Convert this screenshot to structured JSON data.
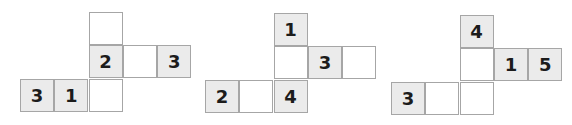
{
  "colors": {
    "shaded": "#ebebeb",
    "blank": "#ffffff",
    "border": "#a6a6a6",
    "text": "#1c1c1c"
  },
  "nets": [
    {
      "origin": [
        20,
        12
      ],
      "cells": [
        {
          "col": 2,
          "row": 0,
          "label": "",
          "shaded": false
        },
        {
          "col": 2,
          "row": 1,
          "label": "2",
          "shaded": true
        },
        {
          "col": 3,
          "row": 1,
          "label": "",
          "shaded": false
        },
        {
          "col": 4,
          "row": 1,
          "label": "3",
          "shaded": true
        },
        {
          "col": 0,
          "row": 2,
          "label": "3",
          "shaded": true
        },
        {
          "col": 1,
          "row": 2,
          "label": "1",
          "shaded": true
        },
        {
          "col": 2,
          "row": 2,
          "label": "",
          "shaded": false
        }
      ]
    },
    {
      "origin": [
        205,
        13
      ],
      "cells": [
        {
          "col": 2,
          "row": 0,
          "label": "1",
          "shaded": true
        },
        {
          "col": 2,
          "row": 1,
          "label": "",
          "shaded": false
        },
        {
          "col": 3,
          "row": 1,
          "label": "3",
          "shaded": true
        },
        {
          "col": 4,
          "row": 1,
          "label": "",
          "shaded": false
        },
        {
          "col": 0,
          "row": 2,
          "label": "2",
          "shaded": true
        },
        {
          "col": 1,
          "row": 2,
          "label": "",
          "shaded": false
        },
        {
          "col": 2,
          "row": 2,
          "label": "4",
          "shaded": true
        }
      ]
    },
    {
      "origin": [
        391,
        15
      ],
      "cells": [
        {
          "col": 2,
          "row": 0,
          "label": "4",
          "shaded": true
        },
        {
          "col": 2,
          "row": 1,
          "label": "",
          "shaded": false
        },
        {
          "col": 3,
          "row": 1,
          "label": "1",
          "shaded": true
        },
        {
          "col": 4,
          "row": 1,
          "label": "5",
          "shaded": true
        },
        {
          "col": 0,
          "row": 2,
          "label": "3",
          "shaded": true
        },
        {
          "col": 1,
          "row": 2,
          "label": "",
          "shaded": false
        },
        {
          "col": 2,
          "row": 2,
          "label": "",
          "shaded": false
        }
      ]
    }
  ]
}
